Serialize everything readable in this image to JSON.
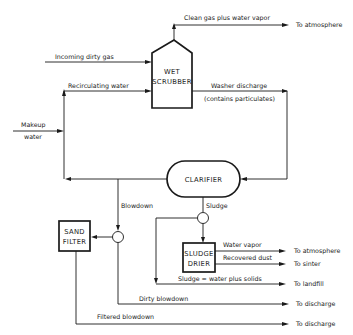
{
  "diagram": {
    "nodes": {
      "scrubber": {
        "line1": "WET",
        "line2": "SCRUBBER"
      },
      "clarifier": {
        "label": "CLARIFIER"
      },
      "sand_filter": {
        "line1": "SAND",
        "line2": "FILTER"
      },
      "sludge_drier": {
        "line1": "SLUDGE",
        "line2": "DRIER"
      }
    },
    "flows": {
      "clean_gas": "Clean gas plus water vapor",
      "incoming_gas": "Incoming dirty gas",
      "recirculating": "Recirculating water",
      "washer_discharge_1": "Washer discharge",
      "washer_discharge_2": "(contains particulates)",
      "makeup_1": "Makeup",
      "makeup_2": "water",
      "blowdown": "Blowdown",
      "sludge": "Sludge",
      "water_vapor": "Water vapor",
      "recovered_dust": "Recovered dust",
      "sludge_solids": "Sludge = water plus solids",
      "dirty_blowdown": "Dirty blowdown",
      "filtered_blowdown": "Filtered blowdown"
    },
    "destinations": {
      "atmosphere_top": "To atmosphere",
      "atmosphere_drier": "To atmosphere",
      "sinter": "To sinter",
      "landfill": "To landfill",
      "discharge_dirty": "To discharge",
      "discharge_filtered": "To discharge"
    }
  }
}
